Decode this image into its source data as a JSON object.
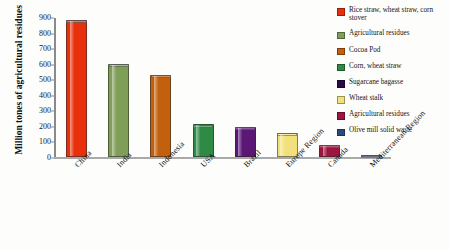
{
  "chart_data": {
    "type": "bar",
    "title": "",
    "xlabel": "",
    "ylabel": "Million tones of agricultural residues",
    "ylim": [
      0,
      900
    ],
    "ytick_labels": [
      "900",
      "800",
      "700",
      "600",
      "500",
      "400",
      "300",
      "200",
      "100",
      "0"
    ],
    "ytick_values": [
      900,
      800,
      700,
      600,
      500,
      400,
      300,
      200,
      100,
      0
    ],
    "grid": false,
    "legend_position": "right",
    "categories": [
      "China",
      "India",
      "Indonesia",
      "USA",
      "Brazil",
      "Europe Region",
      "Canada",
      "Mediterranean Region"
    ],
    "values": [
      880,
      600,
      530,
      210,
      195,
      155,
      80,
      10
    ],
    "colors": [
      "#e8310c",
      "#7f9e58",
      "#c2600e",
      "#2f8a45",
      "#5a1775",
      "#f2e07a",
      "#9c1440",
      "#2e4a7d"
    ],
    "legend": [
      {
        "label": "Rice straw, wheat straw, corn stover",
        "color": "#e8310c"
      },
      {
        "label": "Agricultural residues",
        "color": "#7f9e58"
      },
      {
        "label": "Cocoa Pod",
        "color": "#c2600e"
      },
      {
        "label": "Corn, wheat straw",
        "color": "#2f8a45"
      },
      {
        "label": "Sugarcane bagasse",
        "color": "#2b0a4a"
      },
      {
        "label": "Wheat stalk",
        "color": "#f2e07a"
      },
      {
        "label": "Agricultural residues",
        "color": "#9c1440"
      },
      {
        "label": "Olive mill solid waste",
        "color": "#2e4a7d"
      }
    ]
  }
}
